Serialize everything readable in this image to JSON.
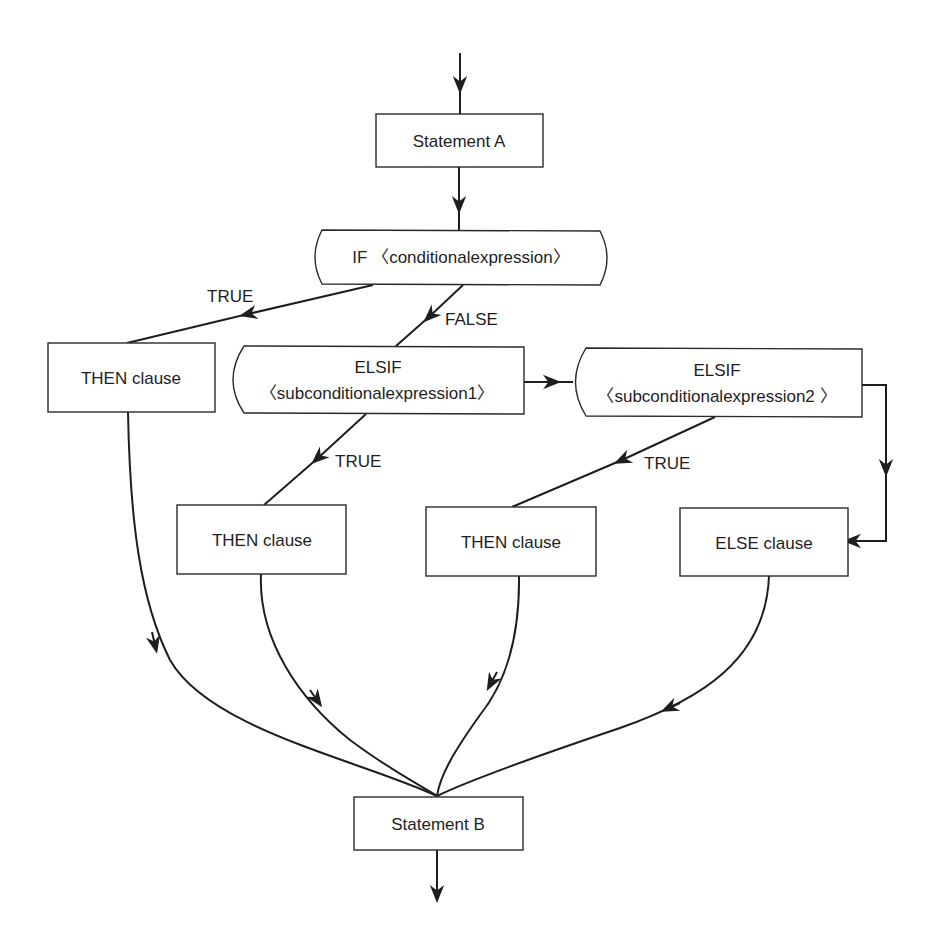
{
  "diagram": {
    "type": "flowchart",
    "nodes": {
      "stmt_a": {
        "label": "Statement A",
        "shape": "rectangle"
      },
      "if": {
        "label": "IF 〈conditionalexpression〉",
        "shape": "decision-rounded"
      },
      "then1": {
        "label": "THEN clause",
        "shape": "rectangle"
      },
      "elsif1": {
        "line1": "ELSIF",
        "line2": "〈subconditionalexpression1〉",
        "shape": "decision-rounded-left"
      },
      "elsif2": {
        "line1": "ELSIF",
        "line2": "〈subconditionalexpression2 〉",
        "shape": "decision-rounded-left"
      },
      "then2": {
        "label": "THEN clause",
        "shape": "rectangle"
      },
      "then3": {
        "label": "THEN clause",
        "shape": "rectangle"
      },
      "else": {
        "label": "ELSE clause",
        "shape": "rectangle"
      },
      "stmt_b": {
        "label": "Statement B",
        "shape": "rectangle"
      }
    },
    "edge_labels": {
      "if_true": "TRUE",
      "if_false": "FALSE",
      "elsif1_true": "TRUE",
      "elsif2_true": "TRUE"
    },
    "edges": [
      {
        "from": "entry",
        "to": "stmt_a"
      },
      {
        "from": "stmt_a",
        "to": "if"
      },
      {
        "from": "if",
        "to": "then1",
        "label": "TRUE"
      },
      {
        "from": "if",
        "to": "elsif1",
        "label": "FALSE"
      },
      {
        "from": "elsif1",
        "to": "then2",
        "label": "TRUE"
      },
      {
        "from": "elsif1",
        "to": "elsif2"
      },
      {
        "from": "elsif2",
        "to": "then3",
        "label": "TRUE"
      },
      {
        "from": "elsif2",
        "to": "else"
      },
      {
        "from": "then1",
        "to": "stmt_b"
      },
      {
        "from": "then2",
        "to": "stmt_b"
      },
      {
        "from": "then3",
        "to": "stmt_b"
      },
      {
        "from": "else",
        "to": "stmt_b"
      },
      {
        "from": "stmt_b",
        "to": "exit"
      }
    ]
  }
}
